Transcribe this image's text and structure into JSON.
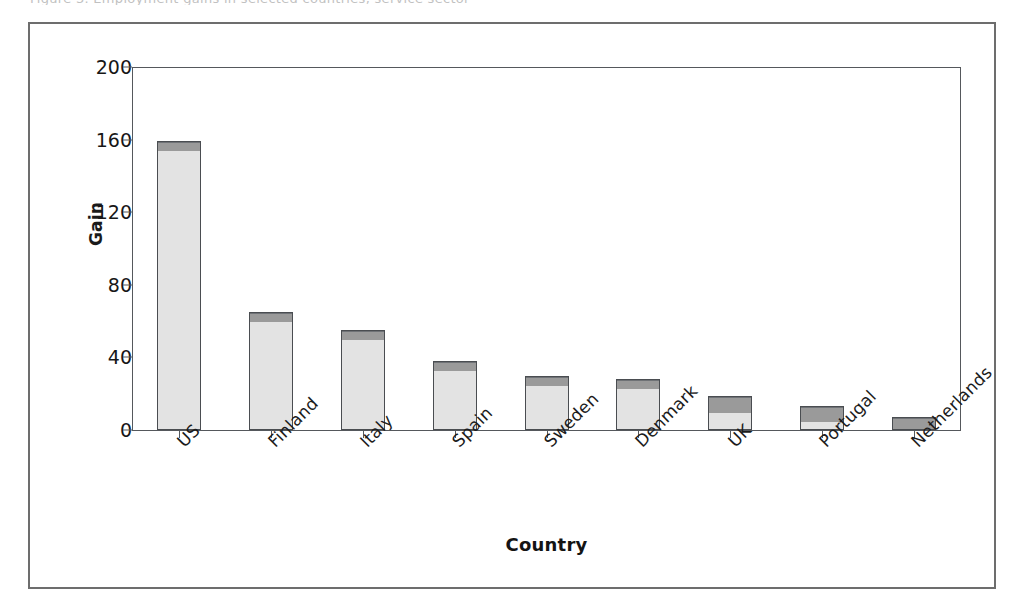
{
  "figure": {
    "top_clip_text": "Figure 3. Employment gains in selected countries, service sector",
    "frame_color": "#6d6d6d",
    "plot_border_color": "#55585c"
  },
  "chart_data": {
    "type": "bar",
    "title": "",
    "subtitle": "",
    "xlabel": "Country",
    "ylabel": "Gain",
    "categories": [
      "US",
      "Finland",
      "Italy",
      "Spain",
      "Sweden",
      "Denmark",
      "UK",
      "Portugal",
      "Netherlands"
    ],
    "values": [
      159,
      65,
      55,
      38,
      30,
      28,
      19,
      13,
      7
    ],
    "series": [
      {
        "name": "base",
        "color": "#9a9a9a",
        "values": [
          5,
          5,
          5,
          5,
          5,
          5,
          9,
          8,
          7
        ]
      },
      {
        "name": "upper",
        "color": "#e3e3e3",
        "values": [
          154,
          60,
          50,
          33,
          25,
          23,
          10,
          5,
          0
        ]
      }
    ],
    "ylim": [
      0,
      200
    ],
    "yticks": [
      0,
      40,
      80,
      120,
      160,
      200
    ],
    "ytick_labels": [
      "0",
      "40",
      "80",
      "120",
      "160",
      "200"
    ],
    "grid": false,
    "legend": "none",
    "bar_edge_color": "#4a4d51",
    "xtick_label_rotation": -45
  }
}
